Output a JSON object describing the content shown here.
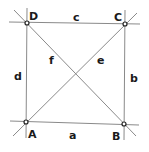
{
  "diagram": {
    "type": "quadrilateral",
    "vertices": [
      {
        "id": "A",
        "label": "A",
        "x": 26,
        "y": 122,
        "lx": 28,
        "ly": 138
      },
      {
        "id": "B",
        "label": "B",
        "x": 124,
        "y": 124,
        "lx": 112,
        "ly": 140
      },
      {
        "id": "C",
        "label": "C",
        "x": 125,
        "y": 24,
        "lx": 114,
        "ly": 21
      },
      {
        "id": "D",
        "label": "D",
        "x": 27,
        "y": 23,
        "lx": 29,
        "ly": 20
      }
    ],
    "sides": [
      {
        "id": "a",
        "label": "a",
        "from": "A",
        "to": "B",
        "lx": 69,
        "ly": 139
      },
      {
        "id": "b",
        "label": "b",
        "from": "B",
        "to": "C",
        "lx": 130,
        "ly": 82
      },
      {
        "id": "c",
        "label": "c",
        "from": "C",
        "to": "D",
        "lx": 73,
        "ly": 21
      },
      {
        "id": "d",
        "label": "d",
        "from": "D",
        "to": "A",
        "lx": 14,
        "ly": 80
      }
    ],
    "diagonals": [
      {
        "id": "e",
        "label": "e",
        "from": "A",
        "to": "C",
        "lx": 97,
        "ly": 64
      },
      {
        "id": "f",
        "label": "f",
        "from": "B",
        "to": "D",
        "lx": 49,
        "ly": 64
      }
    ]
  }
}
